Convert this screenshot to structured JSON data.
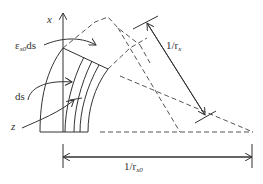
{
  "diagram": {
    "labels": {
      "x_axis": "x",
      "strain": {
        "main": "ε",
        "sub": "x0",
        "suffix": "ds"
      },
      "ds": "ds",
      "z": "z",
      "curvature_x": {
        "main": "1/r",
        "sub": "x"
      },
      "curvature_x0": {
        "main": "1/r",
        "sub": "x0"
      }
    },
    "colors": {
      "line": "#333333",
      "dashed": "#555555",
      "background": "#ffffff"
    }
  }
}
